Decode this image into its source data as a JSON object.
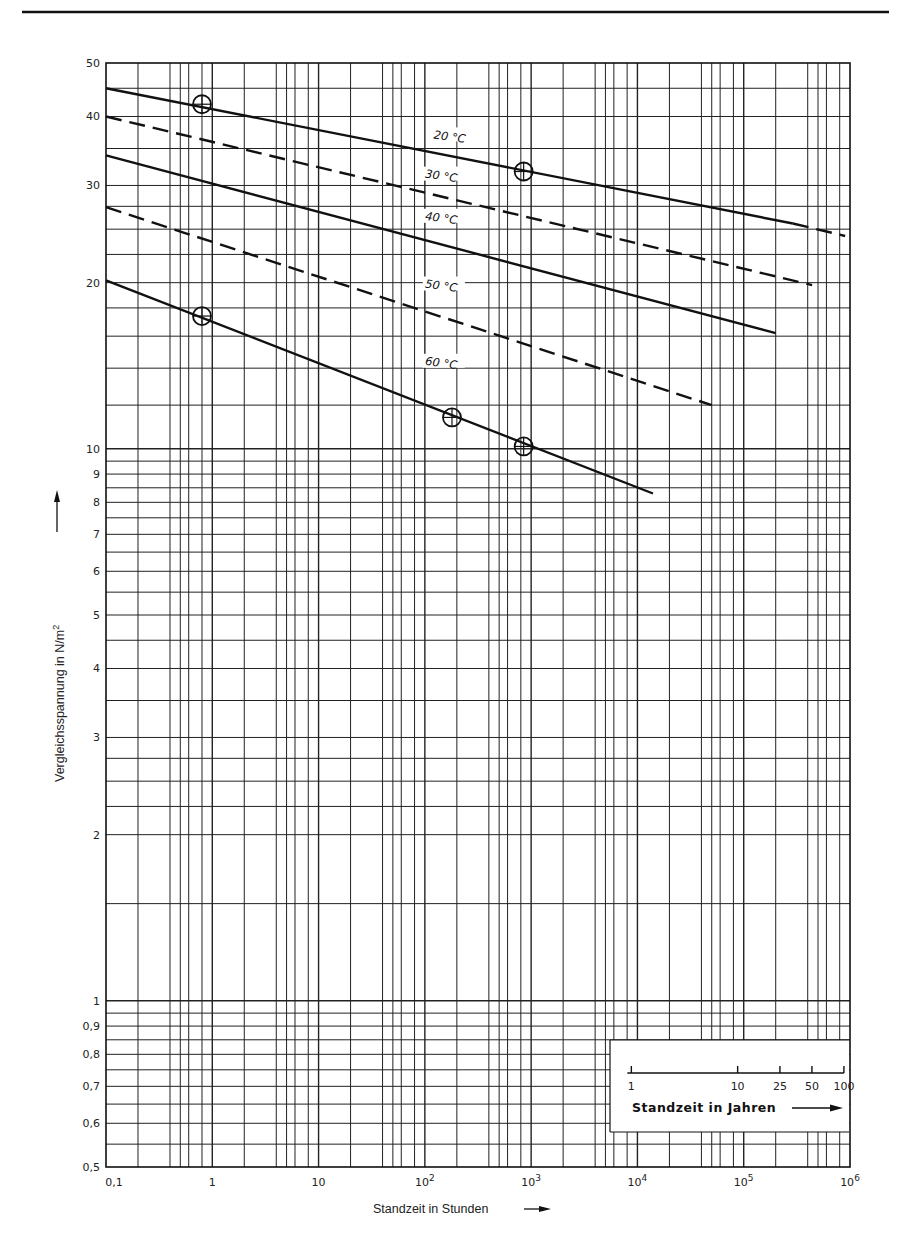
{
  "page": {
    "header_rule": true
  },
  "chart_data": {
    "type": "line",
    "title": "",
    "xscale": "log",
    "yscale": "log",
    "xlabel": "Standzeit in Stunden",
    "ylabel": "Vergleichsspannung in N/m²",
    "xlim": [
      0.1,
      1000000
    ],
    "ylim": [
      0.5,
      50
    ],
    "grid": true,
    "x_tick_labels": [
      {
        "value": 0.1,
        "label": "0,1"
      },
      {
        "value": 1,
        "label": "1"
      },
      {
        "value": 10,
        "label": "10"
      },
      {
        "value": 100,
        "label": "10",
        "exp": "2"
      },
      {
        "value": 1000,
        "label": "10",
        "exp": "3"
      },
      {
        "value": 10000,
        "label": "10",
        "exp": "4"
      },
      {
        "value": 100000,
        "label": "10",
        "exp": "5"
      },
      {
        "value": 1000000,
        "label": "10",
        "exp": "6"
      }
    ],
    "y_tick_labels": [
      {
        "value": 50,
        "label": "50"
      },
      {
        "value": 40,
        "label": "40"
      },
      {
        "value": 30,
        "label": "30"
      },
      {
        "value": 20,
        "label": "20"
      },
      {
        "value": 10,
        "label": "10"
      },
      {
        "value": 9,
        "label": "9"
      },
      {
        "value": 8,
        "label": "8"
      },
      {
        "value": 7,
        "label": "7"
      },
      {
        "value": 6,
        "label": "6"
      },
      {
        "value": 5,
        "label": "5"
      },
      {
        "value": 4,
        "label": "4"
      },
      {
        "value": 3,
        "label": "3"
      },
      {
        "value": 2,
        "label": "2"
      },
      {
        "value": 1,
        "label": "1"
      },
      {
        "value": 0.9,
        "label": "0,9"
      },
      {
        "value": 0.8,
        "label": "0,8"
      },
      {
        "value": 0.7,
        "label": "0,7"
      },
      {
        "value": 0.6,
        "label": "0,6"
      },
      {
        "value": 0.5,
        "label": "0,5"
      }
    ],
    "x_grid_minor": [
      1,
      2,
      4,
      5,
      6,
      8
    ],
    "y_grid": [
      0.5,
      0.55,
      0.6,
      0.65,
      0.7,
      0.75,
      0.8,
      0.85,
      0.9,
      0.95,
      1,
      1.5,
      2,
      2.25,
      2.5,
      2.75,
      3,
      3.5,
      4,
      4.5,
      5,
      5.5,
      6,
      6.5,
      7,
      7.5,
      8,
      8.5,
      9,
      9.5,
      10,
      12,
      14,
      16,
      18,
      20,
      22.5,
      25,
      27.5,
      30,
      35,
      40,
      45,
      50
    ],
    "series": [
      {
        "name": "20 °C",
        "label": "20 °C",
        "style": "solid",
        "x": [
          0.1,
          290000
        ],
        "y": [
          45.0,
          25.6
        ],
        "dashed_extension": {
          "x": [
            290000,
            900000
          ],
          "y": [
            25.6,
            24.3
          ]
        },
        "label_at": {
          "x": 120,
          "y": 36.5
        }
      },
      {
        "name": "30 °C",
        "label": "30 °C",
        "style": "dashed",
        "x": [
          0.1,
          440000
        ],
        "y": [
          40.0,
          19.8
        ],
        "label_at": {
          "x": 100,
          "y": 31
        }
      },
      {
        "name": "40 °C",
        "label": "40 °C",
        "style": "solid",
        "x": [
          0.1,
          200000
        ],
        "y": [
          34.0,
          16.2
        ],
        "label_at": {
          "x": 100,
          "y": 26
        }
      },
      {
        "name": "50 °C",
        "label": "50 °C",
        "style": "dashed",
        "x": [
          0.1,
          50000
        ],
        "y": [
          27.4,
          12.0
        ],
        "label_at": {
          "x": 100,
          "y": 19.6
        }
      },
      {
        "name": "60 °C",
        "label": "60 °C",
        "style": "solid",
        "x": [
          0.1,
          14000
        ],
        "y": [
          20.2,
          8.3
        ],
        "label_at": {
          "x": 100,
          "y": 14.2
        }
      }
    ],
    "measured_points": [
      {
        "series": "20 °C",
        "x": 0.8,
        "y": 42.1
      },
      {
        "series": "20 °C",
        "x": 850,
        "y": 31.8
      },
      {
        "series": "60 °C",
        "x": 0.8,
        "y": 17.4
      },
      {
        "series": "60 °C",
        "x": 180,
        "y": 11.4
      },
      {
        "series": "60 °C",
        "x": 850,
        "y": 10.1
      }
    ],
    "secondary_axis": {
      "label": "Standzeit in Jahren",
      "ticks": [
        {
          "value": 1,
          "label": "1"
        },
        {
          "value": 10,
          "label": "10"
        },
        {
          "value": 25,
          "label": "25"
        },
        {
          "value": 50,
          "label": "50"
        },
        {
          "value": 100,
          "label": "100"
        }
      ],
      "position": "inset lower right"
    }
  },
  "labels": {
    "x_axis_title": "Standzeit in Stunden",
    "y_axis_title": "Vergleichsspannung in N/m",
    "y_axis_title_sup": "2",
    "inset_title": "Standzeit in Jahren"
  },
  "colors": {
    "ink": "#111111",
    "grid": "#222222",
    "background": "#ffffff"
  }
}
